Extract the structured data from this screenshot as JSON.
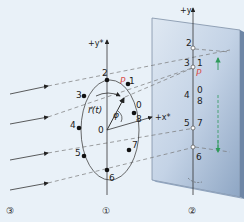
{
  "diagram": {
    "type": "projection of circular motion onto screen",
    "colors": {
      "background": "#e9f1f8",
      "screen": "#b9c9dc",
      "point_p": "#d9534f",
      "green_arrow": "#2e9a5a",
      "lines": "#333333",
      "dashed": "#666666"
    },
    "axes": {
      "y_star": "+y*",
      "x_star": "+x*",
      "y": "+y"
    },
    "circle_labels": {
      "p": "P",
      "r_vector": "r⃗(t)",
      "phi": "φ",
      "origin": "0"
    },
    "circle_points": [
      "1",
      "2",
      "3",
      "4",
      "5",
      "6",
      "7",
      "8",
      "0"
    ],
    "screen_labels": {
      "p": "P",
      "top": "2",
      "row1_left": "3",
      "row1_right": "1",
      "row2_left": "4",
      "row2_right_top": "0",
      "row2_right_bottom": "8",
      "row3_left": "5",
      "row3_right": "7",
      "bottom": "6"
    },
    "markers": {
      "circle": "①",
      "screen": "②",
      "light": "③"
    }
  }
}
